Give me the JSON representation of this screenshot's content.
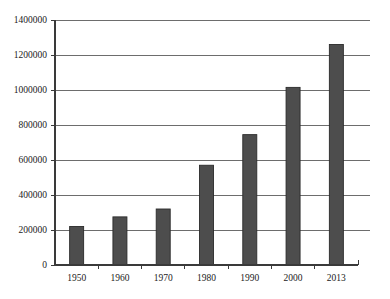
{
  "chart_data": {
    "type": "bar",
    "title": "",
    "xlabel": "",
    "ylabel": "",
    "categories": [
      "1950",
      "1960",
      "1970",
      "1980",
      "1990",
      "2000",
      "2013"
    ],
    "values": [
      220000,
      275000,
      320000,
      570000,
      745000,
      1015000,
      1260000
    ],
    "ylim": [
      0,
      1400000
    ],
    "yticks": [
      0,
      200000,
      400000,
      600000,
      800000,
      1000000,
      1200000,
      1400000
    ],
    "ytick_labels": [
      "0",
      "200000",
      "400000",
      "600000",
      "800000",
      "1000000",
      "1200000",
      "1400000"
    ],
    "grid": true,
    "legend": false,
    "bar_color": "#4d4d4d",
    "bar_edge_color": "#2b2b2b",
    "gridline_color": "#6d6d6d",
    "axis_color": "#3a3a3a",
    "background_color": "#ffffff",
    "series": [
      {
        "name": "values",
        "values": [
          220000,
          275000,
          320000,
          570000,
          745000,
          1015000,
          1260000
        ]
      }
    ]
  }
}
